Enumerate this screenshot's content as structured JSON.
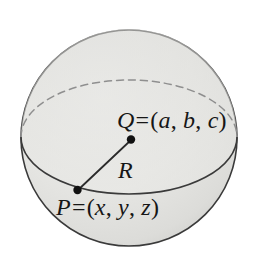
{
  "figure": {
    "type": "geometry-diagram",
    "background_color": "#ffffff",
    "sphere": {
      "fill_color": "#e4e4e2",
      "outline_color": "#3a3a3a",
      "center_x": 129,
      "center_y": 138,
      "radius": 108
    },
    "equator": {
      "front_arc_style": "solid",
      "back_arc_style": "dashed",
      "outline_color": "#3a3a3a",
      "dash_color": "#8f8f8f",
      "semi_major_axis": 108,
      "semi_minor_axis": 57,
      "center_y": 137
    },
    "radius_segment": {
      "label": "R",
      "from_point": "P",
      "to_point": "Q",
      "color": "#2b2b2b"
    },
    "points": [
      {
        "name": "P",
        "label": "P = (x, y, z)",
        "symbol": "P",
        "coordinates_text": "(x, y, z)",
        "components": [
          "x",
          "y",
          "z"
        ],
        "marker": "filled-dot",
        "x": 77,
        "y": 190
      },
      {
        "name": "Q",
        "label": "Q = (a, b, c)",
        "symbol": "Q",
        "coordinates_text": "(a, b, c)",
        "components": [
          "a",
          "b",
          "c"
        ],
        "marker": "filled-dot",
        "x": 131,
        "y": 139
      }
    ],
    "labels": {
      "point_q": {
        "symbol": "Q",
        "equals": "=",
        "open": "(",
        "c1": "a",
        "sep1": ",",
        "c2": "b",
        "sep2": ",",
        "c3": "c",
        "close": ")"
      },
      "point_p": {
        "symbol": "P",
        "equals": "=",
        "open": "(",
        "c1": "x",
        "sep1": ",",
        "c2": "y",
        "sep2": ",",
        "c3": "z",
        "close": ")"
      },
      "radius": {
        "symbol": "R"
      }
    }
  }
}
